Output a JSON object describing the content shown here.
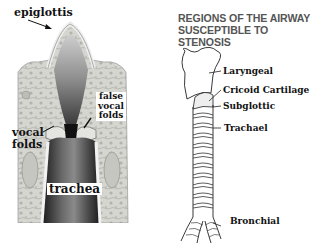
{
  "left_figure": {
    "description": "Coronal section of larynx and trachea",
    "labels": {
      "epiglottis": "epiglottis",
      "false_vocal_folds_line1": "false",
      "false_vocal_folds_line2": "vocal",
      "false_vocal_folds_line3": "folds",
      "vocal_folds_line1": "vocal",
      "vocal_folds_line2": "folds",
      "trachea": "trachea"
    }
  },
  "right_figure": {
    "title_line1": "REGIONS OF THE AIRWAY",
    "title_line2": "SUSCEPTIBLE TO STENOSIS",
    "regions": [
      {
        "label": "Laryngeal"
      },
      {
        "label": "Cricoid Cartilage"
      },
      {
        "label": "Subglottic"
      },
      {
        "label": "Trachael"
      },
      {
        "label": "Bronchial"
      }
    ]
  },
  "colors": {
    "title_gray": "#555555",
    "label_black": "#111111",
    "tissue_light": "#d8d8d2",
    "lumen_dark": "#2a2a2a"
  }
}
